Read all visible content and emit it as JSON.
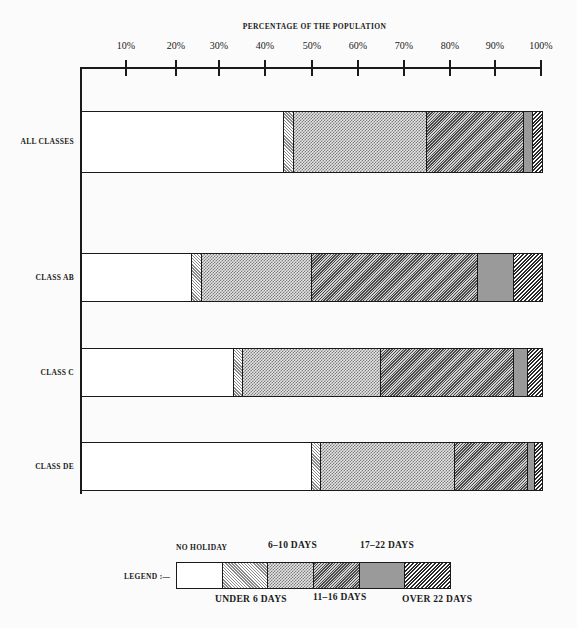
{
  "chart_data": {
    "type": "bar",
    "orientation": "horizontal",
    "stacked": true,
    "title": "PERCENTAGE OF THE POPULATION",
    "xlabel": "PERCENTAGE OF THE POPULATION",
    "ylabel": "",
    "xlim": [
      0,
      100
    ],
    "x_ticks": [
      "10%",
      "20%",
      "30%",
      "40%",
      "50%",
      "60%",
      "70%",
      "80%",
      "90%",
      "100%"
    ],
    "categories": [
      "ALL CLASSES",
      "CLASS AB",
      "CLASS C",
      "CLASS DE"
    ],
    "series": [
      {
        "name": "NO HOLIDAY",
        "pattern": "none",
        "values": [
          44,
          24,
          33,
          50
        ]
      },
      {
        "name": "UNDER 6 DAYS",
        "pattern": "u6",
        "values": [
          2,
          2,
          2,
          2
        ]
      },
      {
        "name": "6-10 DAYS",
        "pattern": "610",
        "values": [
          29,
          24,
          30,
          29
        ]
      },
      {
        "name": "11-16 DAYS",
        "pattern": "1116",
        "values": [
          21,
          36,
          29,
          16
        ]
      },
      {
        "name": "17-22 DAYS",
        "pattern": "1722",
        "values": [
          2,
          8,
          3,
          1.5
        ]
      },
      {
        "name": "OVER 22 DAYS",
        "pattern": "o22",
        "values": [
          2,
          6,
          3,
          1.5
        ]
      }
    ],
    "legend_position": "bottom",
    "grid": false
  },
  "axis": {
    "title": "PERCENTAGE OF THE POPULATION",
    "ticks": [
      {
        "label": "10%",
        "x": 126
      },
      {
        "label": "20%",
        "x": 176
      },
      {
        "label": "30%",
        "x": 219
      },
      {
        "label": "40%",
        "x": 265
      },
      {
        "label": "50%",
        "x": 312
      },
      {
        "label": "60%",
        "x": 358
      },
      {
        "label": "70%",
        "x": 404
      },
      {
        "label": "80%",
        "x": 450
      },
      {
        "label": "90%",
        "x": 495
      },
      {
        "label": "100%",
        "x": 541
      }
    ]
  },
  "rows": [
    {
      "label": "ALL CLASSES",
      "top": 111,
      "height": 62
    },
    {
      "label": "CLASS AB",
      "top": 253,
      "height": 49
    },
    {
      "label": "CLASS C",
      "top": 348,
      "height": 49
    },
    {
      "label": "CLASS DE",
      "top": 442,
      "height": 49
    }
  ],
  "legend": {
    "prefix": "LEGEND :—",
    "top_labels": [
      "NO HOLIDAY",
      "6–10 DAYS",
      "17–22 DAYS"
    ],
    "bottom_labels": [
      "UNDER 6 DAYS",
      "11–16 DAYS",
      "OVER 22 DAYS"
    ]
  }
}
